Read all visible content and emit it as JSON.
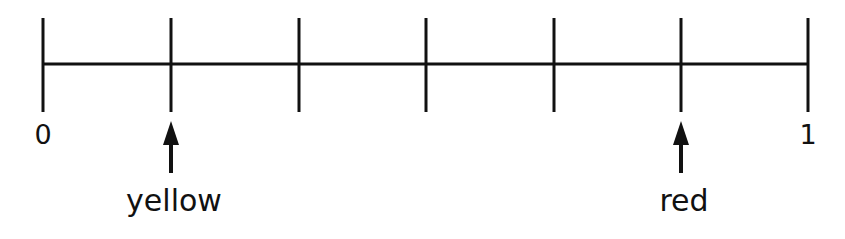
{
  "diagram": {
    "type": "number-line",
    "start_label": "0",
    "end_label": "1",
    "divisions": 6,
    "tick_positions": [
      0,
      0.1667,
      0.3333,
      0.5,
      0.6667,
      0.8333,
      1
    ],
    "markers": [
      {
        "label": "yellow",
        "tick_index": 1,
        "value": "1/6"
      },
      {
        "label": "red",
        "tick_index": 5,
        "value": "5/6"
      }
    ],
    "line_color": "#111111"
  }
}
